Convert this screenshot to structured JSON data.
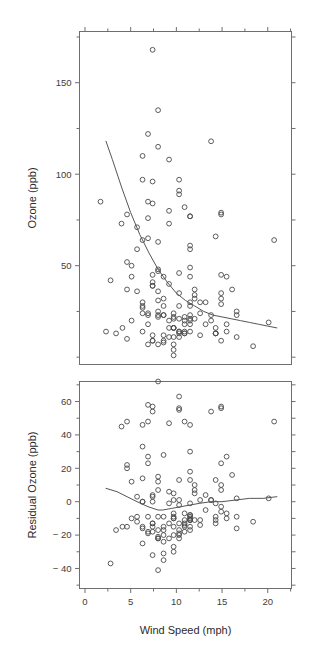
{
  "figure": {
    "width": 314,
    "height": 656,
    "background": "#ffffff",
    "point_color": "#4a4a4a",
    "line_color": "#555555",
    "axis_color": "#6e6e6e"
  },
  "xaxis": {
    "label": "Wind Speed (mph)",
    "ticks": [
      0,
      5,
      10,
      15,
      20
    ],
    "tick_labels": [
      "0",
      "5",
      "10",
      "15",
      "20"
    ],
    "minor_ticks": [
      2.5,
      7.5,
      12.5,
      17.5,
      22.5
    ],
    "lim": [
      -0.6,
      22.6
    ]
  },
  "chart_data": [
    {
      "type": "scatter",
      "panel": "top",
      "title": "",
      "xlabel": "",
      "ylabel": "Ozone (ppb)",
      "xlim": [
        -0.6,
        22.6
      ],
      "ylim": [
        -4,
        178
      ],
      "grid": false,
      "legend": "none",
      "yticks": [
        50,
        100,
        150
      ],
      "ytick_labels": [
        "50",
        "100",
        "150"
      ],
      "yminor_ticks": [
        0,
        25,
        75,
        125,
        175
      ],
      "xticks": [
        0,
        5,
        10,
        15,
        20
      ],
      "marker": "open-circle",
      "x": [
        7.4,
        8.0,
        12.6,
        11.5,
        8.6,
        13.8,
        20.1,
        8.6,
        6.9,
        9.7,
        9.2,
        10.9,
        13.2,
        11.5,
        12.0,
        18.4,
        11.5,
        9.7,
        9.7,
        16.6,
        9.7,
        12.0,
        16.6,
        14.9,
        8.0,
        12.0,
        14.9,
        5.7,
        7.4,
        8.6,
        9.7,
        16.1,
        9.2,
        8.6,
        14.3,
        8.0,
        11.5,
        14.9,
        20.7,
        9.2,
        11.5,
        10.3,
        6.3,
        1.7,
        4.6,
        6.3,
        8.0,
        8.0,
        10.3,
        11.5,
        14.9,
        8.0,
        4.1,
        9.2,
        9.2,
        10.9,
        4.6,
        10.9,
        5.1,
        6.3,
        5.7,
        7.4,
        8.6,
        14.3,
        14.9,
        14.9,
        14.3,
        6.9,
        10.3,
        6.3,
        5.1,
        11.5,
        6.9,
        9.7,
        11.5,
        8.6,
        8.0,
        8.6,
        12.0,
        7.4,
        7.4,
        7.4,
        9.2,
        6.9,
        13.8,
        7.4,
        6.9,
        7.4,
        4.6,
        4.0,
        10.3,
        8.0,
        8.6,
        11.5,
        11.5,
        11.5,
        9.7,
        11.5,
        10.3,
        6.3,
        7.4,
        10.9,
        10.3,
        15.5,
        14.3,
        12.6,
        9.7,
        3.4,
        8.0,
        5.7,
        9.7,
        2.3,
        6.3,
        6.3,
        6.9,
        5.1,
        2.8,
        4.6,
        7.4,
        15.5,
        10.9,
        10.3,
        10.9,
        9.7,
        14.9,
        15.5,
        6.3,
        10.9,
        11.5,
        6.9,
        13.8,
        10.3,
        10.3,
        8.0,
        12.6,
        9.2,
        10.3,
        10.3,
        16.6,
        6.9,
        13.2,
        14.3,
        8.0,
        11.5
      ],
      "y": [
        41,
        36,
        12,
        18,
        28,
        23,
        19,
        8,
        7,
        16,
        11,
        14,
        18,
        14,
        34,
        6,
        30,
        11,
        1,
        11,
        4,
        32,
        23,
        45,
        115,
        37,
        29,
        71,
        39,
        23,
        21,
        37,
        20,
        12,
        13,
        135,
        49,
        32,
        64,
        40,
        77,
        97,
        97,
        85,
        10,
        27,
        7,
        48,
        35,
        61,
        79,
        63,
        16,
        80,
        108,
        20,
        52,
        82,
        50,
        64,
        59,
        39,
        9,
        16,
        78,
        35,
        66,
        122,
        89,
        110,
        44,
        28,
        65,
        22,
        59,
        23,
        31,
        44,
        21,
        9,
        45,
        168,
        73,
        76,
        118,
        84,
        85,
        96,
        78,
        73,
        91,
        47,
        32,
        20,
        23,
        21,
        24,
        44,
        21,
        28,
        9,
        13,
        46,
        18,
        13,
        24,
        16,
        13,
        23,
        36,
        7,
        14,
        30,
        14,
        18,
        20,
        42,
        37,
        12,
        14,
        13,
        14,
        22,
        16,
        9,
        44,
        24,
        18,
        77,
        24,
        20,
        14,
        28,
        25,
        30,
        16,
        11,
        13,
        25,
        23,
        30,
        13,
        22
      ],
      "annotations": [
        {
          "text": "fitted smooth (exponential-like decay)",
          "series": "smooth"
        }
      ],
      "smooth_curve": {
        "description": "monotone decreasing fit from ~118 ppb at 2.3 mph to ~16 ppb at 21 mph",
        "x": [
          2.3,
          3.0,
          4.0,
          5.0,
          6.0,
          7.0,
          8.0,
          9.0,
          10.0,
          11.0,
          12.0,
          13.0,
          14.0,
          15.0,
          16.0,
          17.0,
          18.0,
          19.0,
          20.0,
          21.0
        ],
        "y": [
          118,
          108,
          93,
          79,
          67,
          57,
          48,
          41,
          35,
          31,
          28,
          25,
          23,
          22,
          21,
          20,
          19,
          18,
          17,
          16
        ]
      }
    },
    {
      "type": "scatter",
      "panel": "bottom",
      "title": "",
      "xlabel": "Wind Speed (mph)",
      "ylabel": "Residual Ozone (ppb)",
      "xlim": [
        -0.6,
        22.6
      ],
      "ylim": [
        -52,
        72
      ],
      "grid": false,
      "legend": "none",
      "yticks": [
        -40,
        -20,
        0,
        20,
        40,
        60
      ],
      "ytick_labels": [
        "− 40",
        "− 20",
        "0",
        "20",
        "40",
        "60"
      ],
      "yminor_ticks": [
        -50,
        -30,
        -10,
        10,
        30,
        50,
        70
      ],
      "xticks": [
        0,
        5,
        10,
        15,
        20
      ],
      "marker": "open-circle",
      "x": [
        7.4,
        8.0,
        12.6,
        11.5,
        8.6,
        13.8,
        20.1,
        8.6,
        6.9,
        9.7,
        9.2,
        10.9,
        13.2,
        11.5,
        12.0,
        18.4,
        11.5,
        9.7,
        9.7,
        16.6,
        9.7,
        12.0,
        16.6,
        14.9,
        8.0,
        12.0,
        14.9,
        5.7,
        7.4,
        8.6,
        9.7,
        16.1,
        9.2,
        8.6,
        14.3,
        8.0,
        11.5,
        14.9,
        20.7,
        9.2,
        11.5,
        10.3,
        6.3,
        4.6,
        6.3,
        8.0,
        8.0,
        10.3,
        11.5,
        14.9,
        8.0,
        4.1,
        9.2,
        9.2,
        10.9,
        4.6,
        10.9,
        5.1,
        6.3,
        5.7,
        7.4,
        8.6,
        14.3,
        14.9,
        14.9,
        14.3,
        6.9,
        10.3,
        6.3,
        5.1,
        11.5,
        6.9,
        9.7,
        11.5,
        8.6,
        8.0,
        8.6,
        12.0,
        7.4,
        7.4,
        7.4,
        9.2,
        6.9,
        13.8,
        7.4,
        6.9,
        7.4,
        4.6,
        4.0,
        10.3,
        8.0,
        8.6,
        11.5,
        11.5,
        11.5,
        9.7,
        11.5,
        10.3,
        6.3,
        7.4,
        10.9,
        10.3,
        15.5,
        14.3,
        12.6,
        9.7,
        3.4,
        8.0,
        5.7,
        9.7,
        2.3,
        6.3,
        6.3,
        6.9,
        5.1,
        2.8,
        4.6,
        7.4,
        15.5,
        10.9,
        10.3,
        10.9,
        9.7,
        14.9,
        15.5,
        6.3,
        10.9,
        11.5,
        6.9,
        13.8,
        10.3,
        10.3,
        8.0,
        12.6,
        9.2,
        10.3,
        10.3,
        16.6,
        6.9,
        13.2,
        14.3,
        8.0,
        11.5
      ],
      "y": [
        -13,
        -9,
        -14,
        -11,
        -15,
        1,
        2,
        -35,
        -53,
        -15,
        -22,
        -15,
        -5,
        -17,
        7,
        -12,
        -1,
        -20,
        -30,
        -9,
        -27,
        5,
        2,
        23,
        72,
        10,
        7,
        3,
        -15,
        -20,
        -10,
        16,
        -13,
        -31,
        -9,
        89,
        18,
        10,
        48,
        6,
        46,
        63,
        33,
        20,
        -25,
        -21,
        -41,
        1,
        30,
        57,
        15,
        -15,
        47,
        75,
        -14,
        22,
        48,
        12,
        0,
        -9,
        -13,
        -24,
        -13,
        -6,
        56,
        13,
        58,
        55,
        46,
        80,
        13,
        -19,
        1,
        -9,
        28,
        -17,
        -17,
        -11,
        -18,
        -32,
        4,
        119,
        48,
        54,
        57,
        27,
        54,
        48,
        45,
        56,
        12,
        -9,
        -15,
        -11,
        -8,
        -10,
        -11,
        13,
        -15,
        0,
        -18,
        -22,
        27,
        -11,
        -11,
        -7,
        -17,
        -22,
        -12,
        5,
        -54,
        -16,
        0,
        -18,
        -10,
        -37,
        -15,
        3,
        -7,
        -11,
        -20,
        -13,
        -9,
        -3,
        -10,
        14,
        -7,
        -10,
        23,
        1,
        -13,
        -19,
        -22,
        1,
        -1,
        -17,
        -2,
        -16,
        -9,
        4,
        -1,
        7,
        -8,
        -7
      ],
      "annotations": [
        {
          "text": "loess residual smooth near zero",
          "series": "smooth"
        }
      ],
      "smooth_curve": {
        "description": "loess smooth of residuals, dips to about -5 near 8.5 mph then rises slightly",
        "x": [
          2.3,
          3.5,
          4.6,
          5.7,
          6.9,
          8.0,
          8.5,
          9.5,
          10.5,
          11.5,
          12.5,
          13.8,
          15.0,
          16.5,
          18.0,
          19.5,
          21.0
        ],
        "y": [
          8,
          6,
          3,
          0,
          -3,
          -5,
          -5,
          -4,
          -3,
          -2,
          -1,
          0,
          0,
          1,
          2,
          2,
          3
        ]
      }
    }
  ]
}
